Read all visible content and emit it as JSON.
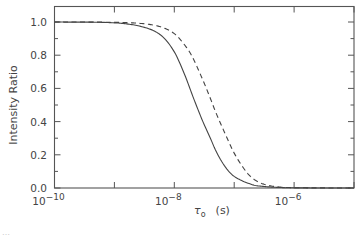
{
  "chart_data": {
    "type": "line",
    "title": "",
    "xlabel": "τo (s)",
    "xlabel_symbol": "τ",
    "xlabel_subscript": "o",
    "xlabel_unit": "(s)",
    "ylabel": "Intensity Ratio",
    "xscale": "log",
    "xlim": [
      1e-10,
      1e-05
    ],
    "ylim": [
      0.0,
      1.0
    ],
    "x_ticks_major": [
      1e-10,
      1e-09,
      1e-08,
      1e-07,
      1e-06,
      1e-05
    ],
    "x_tick_labels": [
      {
        "base": "10",
        "exp": "−10",
        "value": 1e-10
      },
      {
        "base": "10",
        "exp": "−8",
        "value": 1e-08
      },
      {
        "base": "10",
        "exp": "−6",
        "value": 1e-06
      }
    ],
    "y_tick_labels": [
      "0.0",
      "0.2",
      "0.4",
      "0.6",
      "0.8",
      "1.0"
    ],
    "y_ticks": [
      0.0,
      0.2,
      0.4,
      0.6,
      0.8,
      1.0
    ],
    "grid": false,
    "legend": null,
    "series": [
      {
        "name": "solid",
        "style": "solid",
        "x": [
          1e-10,
          1e-09,
          3e-09,
          6e-09,
          1e-08,
          1.5e-08,
          2e-08,
          2.5e-08,
          3e-08,
          4e-08,
          5e-08,
          7e-08,
          1e-07,
          2e-07,
          3e-07,
          5e-07,
          1e-06,
          1e-05
        ],
        "values": [
          1.0,
          0.995,
          0.97,
          0.92,
          0.82,
          0.68,
          0.56,
          0.47,
          0.4,
          0.3,
          0.22,
          0.13,
          0.07,
          0.02,
          0.01,
          0.004,
          0.001,
          0.0
        ]
      },
      {
        "name": "dashed",
        "style": "dashed",
        "x": [
          1e-10,
          1e-09,
          3e-09,
          6e-09,
          1e-08,
          1.5e-08,
          2e-08,
          3e-08,
          4e-08,
          5e-08,
          7e-08,
          1e-07,
          1.5e-07,
          2e-07,
          3e-07,
          5e-07,
          1e-06,
          1e-05
        ],
        "values": [
          1.0,
          0.998,
          0.99,
          0.97,
          0.93,
          0.86,
          0.79,
          0.65,
          0.54,
          0.45,
          0.33,
          0.21,
          0.11,
          0.06,
          0.025,
          0.008,
          0.002,
          0.0
        ]
      }
    ]
  },
  "caption_fragment": "…"
}
